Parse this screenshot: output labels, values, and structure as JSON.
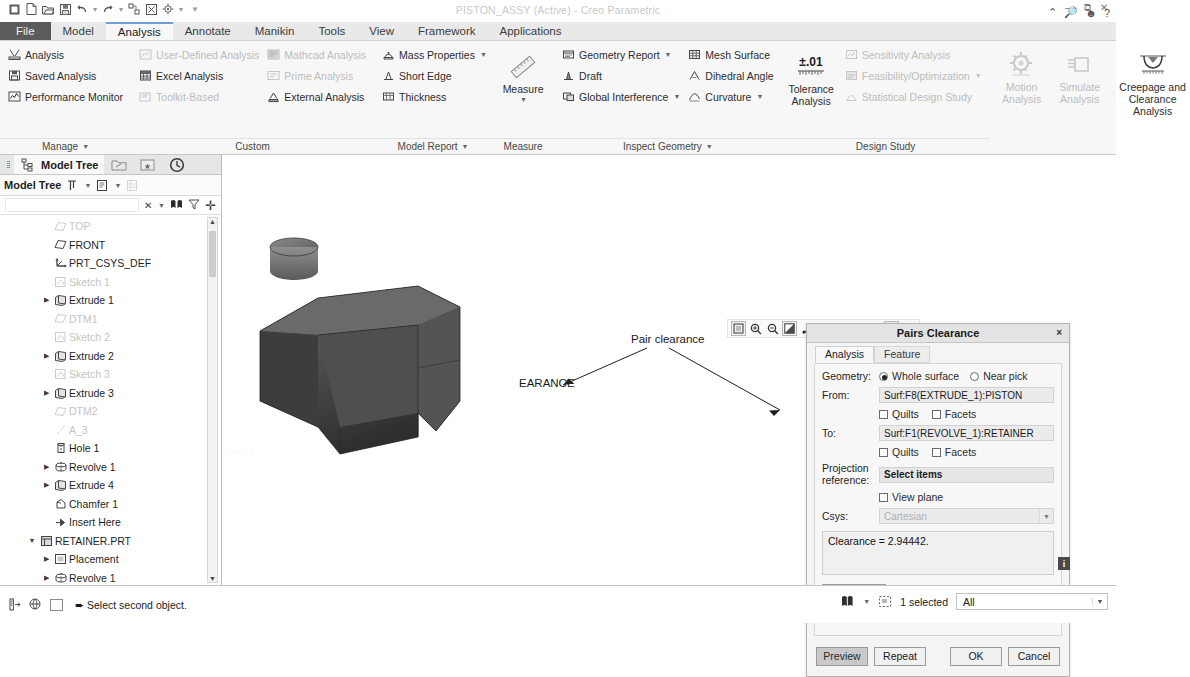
{
  "window": {
    "title": "PISTON_ASSY (Active) - Creo Parametric",
    "quick_access": [
      "app-icon",
      "new-icon",
      "open-icon",
      "save-icon",
      "undo-icon",
      "redo-icon",
      "regenerate-icon",
      "close-window-icon",
      "settings-icon",
      "dropdown-icon"
    ],
    "controls": [
      "minimize-icon",
      "restore-icon",
      "close-icon"
    ],
    "help_icons": [
      "collapse-ribbon-icon",
      "search-icon",
      "account-icon",
      "help-icon"
    ]
  },
  "ribbon": {
    "tabs": [
      {
        "label": "File",
        "state": "file"
      },
      {
        "label": "Model",
        "state": "normal"
      },
      {
        "label": "Analysis",
        "state": "active"
      },
      {
        "label": "Annotate",
        "state": "normal"
      },
      {
        "label": "Manikin",
        "state": "normal"
      },
      {
        "label": "Tools",
        "state": "normal"
      },
      {
        "label": "View",
        "state": "normal"
      },
      {
        "label": "Framework",
        "state": "normal"
      },
      {
        "label": "Applications",
        "state": "normal"
      }
    ],
    "groups": [
      {
        "label": "Manage",
        "label_caret": true,
        "columns": [
          {
            "items": [
              {
                "label": "Analysis",
                "icon": "measure-analysis-icon",
                "dim": false,
                "caret": false
              },
              {
                "label": "Saved Analysis",
                "icon": "saved-analysis-icon",
                "dim": false,
                "caret": false
              },
              {
                "label": "Performance Monitor",
                "icon": "performance-monitor-icon",
                "dim": false,
                "caret": false
              }
            ]
          }
        ]
      },
      {
        "label": "Custom",
        "label_caret": false,
        "columns": [
          {
            "items": [
              {
                "label": "User-Defined Analysis",
                "icon": "user-defined-analysis-icon",
                "dim": true,
                "caret": false
              },
              {
                "label": "Excel Analysis",
                "icon": "excel-analysis-icon",
                "dim": false,
                "caret": false
              },
              {
                "label": "Toolkit-Based",
                "icon": "toolkit-based-icon",
                "dim": true,
                "caret": false
              }
            ]
          },
          {
            "items": [
              {
                "label": "Mathcad Analysis",
                "icon": "mathcad-analysis-icon",
                "dim": true,
                "caret": false
              },
              {
                "label": "Prime Analysis",
                "icon": "prime-analysis-icon",
                "dim": true,
                "caret": false
              },
              {
                "label": "External Analysis",
                "icon": "external-analysis-icon",
                "dim": false,
                "caret": false
              }
            ]
          }
        ]
      },
      {
        "label": "Model Report",
        "label_caret": true,
        "columns": [
          {
            "items": [
              {
                "label": "Mass Properties",
                "icon": "mass-properties-icon",
                "dim": false,
                "caret": true
              },
              {
                "label": "Short Edge",
                "icon": "short-edge-icon",
                "dim": false,
                "caret": false
              },
              {
                "label": "Thickness",
                "icon": "thickness-icon",
                "dim": false,
                "caret": false
              }
            ]
          }
        ]
      },
      {
        "label": "Measure",
        "label_caret": false,
        "big": {
          "label_line1": "Measure",
          "label_line2": "",
          "icon": "measure-ruler-icon",
          "caret": true,
          "dim": false
        }
      },
      {
        "label": "Inspect Geometry",
        "label_caret": true,
        "columns": [
          {
            "items": [
              {
                "label": "Geometry Report",
                "icon": "geometry-report-icon",
                "dim": false,
                "caret": true
              },
              {
                "label": "Draft",
                "icon": "draft-icon",
                "dim": false,
                "caret": false
              },
              {
                "label": "Global Interference",
                "icon": "global-interference-icon",
                "dim": false,
                "caret": true
              }
            ]
          },
          {
            "items": [
              {
                "label": "Mesh Surface",
                "icon": "mesh-surface-icon",
                "dim": false,
                "caret": false
              },
              {
                "label": "Dihedral Angle",
                "icon": "dihedral-angle-icon",
                "dim": false,
                "caret": false
              },
              {
                "label": "Curvature",
                "icon": "curvature-icon",
                "dim": false,
                "caret": true
              }
            ]
          }
        ]
      },
      {
        "label": "Design Study",
        "label_caret": false,
        "big": {
          "label_line1": "Tolerance",
          "label_line2": "Analysis",
          "icon": "tolerance-analysis-icon",
          "caret": true,
          "dim": false
        },
        "columns": [
          {
            "items": [
              {
                "label": "Sensitivity Analysis",
                "icon": "sensitivity-analysis-icon",
                "dim": true,
                "caret": false
              },
              {
                "label": "Feasibility/Optimization",
                "icon": "feasibility-optimization-icon",
                "dim": true,
                "caret": true
              },
              {
                "label": "Statistical Design Study",
                "icon": "statistical-design-study-icon",
                "dim": true,
                "caret": false
              }
            ]
          }
        ]
      },
      {
        "label": "",
        "label_caret": false,
        "bigs": [
          {
            "label_line1": "Motion",
            "label_line2": "Analysis",
            "icon": "motion-analysis-icon",
            "dim": true
          },
          {
            "label_line1": "Simulate",
            "label_line2": "Analysis",
            "icon": "simulate-analysis-icon",
            "dim": true
          },
          {
            "label_line1": "Creepage and",
            "label_line2": "Clearance Analysis",
            "icon": "creepage-clearance-icon",
            "dim": false,
            "wide": true
          }
        ]
      }
    ]
  },
  "model_tree": {
    "tabs": [
      {
        "label": "Model Tree",
        "icon": "model-tree-icon",
        "selected": true
      },
      {
        "label": "",
        "icon": "folder-browser-icon",
        "selected": false
      },
      {
        "label": "",
        "icon": "favorites-icon",
        "selected": false
      },
      {
        "label": "",
        "icon": "history-icon",
        "selected": false
      }
    ],
    "toolbar": {
      "title": "Model Tree",
      "icons": [
        "tree-filters-icon",
        "caret-down-icon",
        "tree-columns-icon",
        "caret-down-icon-2",
        "tree-settings-icon"
      ]
    },
    "filter": {
      "value": "",
      "placeholder": "",
      "icons": [
        "clear-icon",
        "caret-down-icon",
        "find-icon",
        "filter-icon",
        "expand-icon"
      ]
    },
    "items": [
      {
        "label": "TOP",
        "icon": "datum-plane-icon",
        "indent": 1,
        "arrow": "",
        "dim": true
      },
      {
        "label": "FRONT",
        "icon": "datum-plane-icon",
        "indent": 1,
        "arrow": "",
        "dim": false
      },
      {
        "label": "PRT_CSYS_DEF",
        "icon": "csys-icon",
        "indent": 1,
        "arrow": "",
        "dim": false
      },
      {
        "label": "Sketch 1",
        "icon": "sketch-icon",
        "indent": 1,
        "arrow": "",
        "dim": true
      },
      {
        "label": "Extrude 1",
        "icon": "extrude-icon",
        "indent": 1,
        "arrow": "right",
        "dim": false
      },
      {
        "label": "DTM1",
        "icon": "datum-plane-icon",
        "indent": 1,
        "arrow": "",
        "dim": true
      },
      {
        "label": "Sketch 2",
        "icon": "sketch-icon",
        "indent": 1,
        "arrow": "",
        "dim": true
      },
      {
        "label": "Extrude 2",
        "icon": "extrude-icon",
        "indent": 1,
        "arrow": "right",
        "dim": false
      },
      {
        "label": "Sketch 3",
        "icon": "sketch-icon",
        "indent": 1,
        "arrow": "",
        "dim": true
      },
      {
        "label": "Extrude 3",
        "icon": "extrude-icon",
        "indent": 1,
        "arrow": "right",
        "dim": false
      },
      {
        "label": "DTM2",
        "icon": "datum-plane-icon",
        "indent": 1,
        "arrow": "",
        "dim": true
      },
      {
        "label": "A_3",
        "icon": "axis-icon",
        "indent": 1,
        "arrow": "",
        "dim": true
      },
      {
        "label": "Hole 1",
        "icon": "hole-icon",
        "indent": 1,
        "arrow": "",
        "dim": false
      },
      {
        "label": "Revolve 1",
        "icon": "revolve-icon",
        "indent": 1,
        "arrow": "right",
        "dim": false
      },
      {
        "label": "Extrude 4",
        "icon": "extrude-icon",
        "indent": 1,
        "arrow": "right",
        "dim": false
      },
      {
        "label": "Chamfer 1",
        "icon": "chamfer-icon",
        "indent": 1,
        "arrow": "",
        "dim": false
      },
      {
        "label": "Insert Here",
        "icon": "insert-here-icon",
        "indent": 1,
        "arrow": "",
        "dim": false
      },
      {
        "label": "RETAINER.PRT",
        "icon": "part-icon",
        "indent": 0,
        "arrow": "down",
        "dim": false
      },
      {
        "label": "Placement",
        "icon": "placement-icon",
        "indent": 1,
        "arrow": "right",
        "dim": false
      },
      {
        "label": "Revolve 1",
        "icon": "revolve-icon",
        "indent": 1,
        "arrow": "right",
        "dim": false
      },
      {
        "label": "Insert Here",
        "icon": "insert-here-icon",
        "indent": 1,
        "arrow": "",
        "dim": false
      },
      {
        "label": "Insert Here",
        "icon": "insert-here-icon",
        "indent": 0,
        "arrow": "",
        "dim": false
      }
    ]
  },
  "graphics": {
    "toolbar_icons": [
      "refit-icon",
      "zoom-in-icon",
      "zoom-out-icon",
      "repaint-icon",
      "spin-center-icon",
      "display-style-icon",
      "datum-display-icon",
      "saved-orientations-icon",
      "perspective-icon",
      "annotation-display-icon"
    ],
    "annotations": [
      {
        "text": "Pair clearance"
      },
      {
        "text": "EARANCE"
      }
    ],
    "explode_state": "Explode State DEFAULT EXPLODE(+)"
  },
  "dialog": {
    "title": "Pairs Clearance",
    "close": "×",
    "tabs": [
      {
        "label": "Analysis",
        "active": true
      },
      {
        "label": "Feature",
        "active": false
      }
    ],
    "geometry": {
      "label": "Geometry:",
      "options": [
        {
          "label": "Whole surface",
          "selected": true
        },
        {
          "label": "Near pick",
          "selected": false
        }
      ]
    },
    "from": {
      "label": "From:",
      "value": "Surf:F8(EXTRUDE_1):PISTON",
      "checkboxes": [
        {
          "label": "Quilts",
          "checked": false
        },
        {
          "label": "Facets",
          "checked": false
        }
      ]
    },
    "to": {
      "label": "To:",
      "value": "Surf:F1(REVOLVE_1):RETAINER",
      "checkboxes": [
        {
          "label": "Quilts",
          "checked": false
        },
        {
          "label": "Facets",
          "checked": false
        }
      ]
    },
    "projection_reference": {
      "label_line1": "Projection",
      "label_line2": "reference:",
      "button_label": "Select items",
      "checkbox": {
        "label": "View plane",
        "checked": false
      }
    },
    "csys": {
      "label": "Csys:",
      "value": "Cartesian",
      "dropdown_icon": "caret-down-icon"
    },
    "result": {
      "text": "Clearance = 2.94442.",
      "info_icon": "info-icon"
    },
    "quick": {
      "button_label": "Quick",
      "dropdown_icon": "caret-down-icon",
      "name_placeholder": "Clearance_1"
    },
    "footer_buttons": [
      {
        "label": "Preview",
        "pressed": true
      },
      {
        "label": "Repeat",
        "pressed": false
      },
      {
        "label": "OK",
        "pressed": false
      },
      {
        "label": "Cancel",
        "pressed": false
      }
    ]
  },
  "status_bar": {
    "left_icons": [
      "navigator-toggle-icon",
      "browser-toggle-icon",
      "fullscreen-icon"
    ],
    "message": "Select second object.",
    "message_icon": "arrow-right-icon",
    "right_icons": [
      "filter-icon",
      "caret-down-icon",
      "selection-box-icon"
    ],
    "selection_text": "1 selected",
    "filter_value": "All",
    "filter_dropdown_icon": "caret-down-icon"
  }
}
